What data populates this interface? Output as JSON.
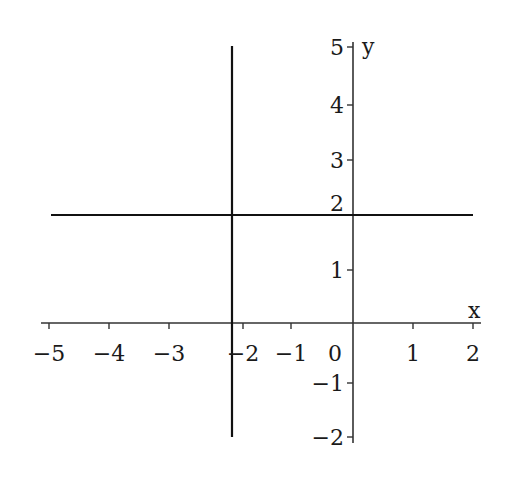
{
  "chart_data": {
    "type": "line",
    "title": "",
    "xlabel": "x",
    "ylabel": "y",
    "xlim": [
      -5,
      2
    ],
    "ylim": [
      -2,
      5
    ],
    "grid": false,
    "legend": null,
    "x_ticks": [
      {
        "label": "−5",
        "px": 49,
        "tick": true
      },
      {
        "label": "−4",
        "px": 109,
        "tick": true
      },
      {
        "label": "−3",
        "px": 169,
        "tick": true
      },
      {
        "label": "−2",
        "px": 243,
        "tick": true
      },
      {
        "label": "−1",
        "px": 291,
        "tick": true
      },
      {
        "label": "0",
        "px": 335,
        "tick": false
      },
      {
        "label": "1",
        "px": 413,
        "tick": true
      },
      {
        "label": "2",
        "px": 473,
        "tick": true
      }
    ],
    "y_ticks": [
      {
        "label": "5",
        "py": 47,
        "tick": true
      },
      {
        "label": "4",
        "py": 105,
        "tick": true
      },
      {
        "label": "3",
        "py": 160,
        "tick": true
      },
      {
        "label": "2",
        "py": 203,
        "tick": false
      },
      {
        "label": "1",
        "py": 270,
        "tick": true
      },
      {
        "label": "−1",
        "py": 383,
        "tick": true
      },
      {
        "label": "−2",
        "py": 437,
        "tick": true
      }
    ],
    "series": [
      {
        "name": "vertical line x = -2.5",
        "kind": "vertical",
        "x": -2.5,
        "px": 232,
        "y_from_px": 46,
        "y_to_px": 437
      },
      {
        "name": "horizontal line y = 2",
        "kind": "horizontal",
        "y": 2,
        "py": 215,
        "x_from_px": 51,
        "x_to_px": 473
      }
    ],
    "axes": {
      "x_axis": {
        "py": 323,
        "x_from_px": 41,
        "x_to_px": 481
      },
      "y_axis": {
        "px": 353,
        "y_from_px": 42,
        "y_to_px": 443
      }
    },
    "colors": {
      "axis": "#333333",
      "line": "#111111",
      "text": "#1a1a1a"
    }
  }
}
